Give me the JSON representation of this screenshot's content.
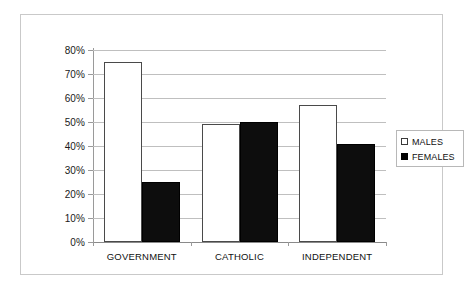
{
  "chart_data": {
    "type": "bar",
    "title": "",
    "subtitle": "",
    "xlabel": "",
    "ylabel": "",
    "categories": [
      "GOVERNMENT",
      "CATHOLIC",
      "INDEPENDENT"
    ],
    "series": [
      {
        "name": "MALES",
        "values": [
          75,
          49,
          57
        ]
      },
      {
        "name": "FEMALES",
        "values": [
          25,
          50,
          41
        ]
      }
    ],
    "ylim": [
      0,
      80
    ],
    "ytick_values": [
      0,
      10,
      20,
      30,
      40,
      50,
      60,
      70,
      80
    ],
    "ytick_labels": [
      "0%",
      "10%",
      "20%",
      "30%",
      "40%",
      "50%",
      "60%",
      "70%",
      "80%"
    ],
    "grid": true,
    "legend_position": "right",
    "legend": [
      {
        "label": "MALES",
        "swatch": "open-square",
        "color": "#ffffff"
      },
      {
        "label": "FEMALES",
        "swatch": "filled-square",
        "color": "#000000"
      }
    ],
    "colors": {
      "males_fill": "#ffffff",
      "males_border": "#4a4a4a",
      "females_fill": "#000000",
      "gridline": "#bfbfbf",
      "axis": "#9a9a9a",
      "frame": "#c9c9c9"
    }
  }
}
